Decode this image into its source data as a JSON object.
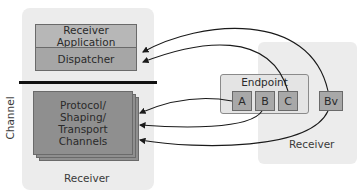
{
  "diagram": {
    "left_receiver": {
      "receiver_application": "Receiver Application",
      "dispatcher": "Dispatcher",
      "channels": "Protocol/ Shaping/ Transport Channels",
      "channels_lines": [
        "Protocol/",
        "Shaping/",
        "Transport",
        "Channels"
      ],
      "footer_label": "Receiver"
    },
    "channel_axis_label": "Channel",
    "endpoint": {
      "title": "Endpoint",
      "items": [
        "A",
        "B",
        "C"
      ]
    },
    "right_receiver": {
      "virtual_item": "Bv",
      "footer_label": "Receiver"
    },
    "colors": {
      "panel_bg": "#ececec",
      "app_box": "#b7b7b7",
      "dispatcher_box": "#a6a6a6",
      "channel_box": "#8f8f8f",
      "endpoint_item": "#a8a8a8",
      "arrow": "#1a1a1a"
    }
  }
}
